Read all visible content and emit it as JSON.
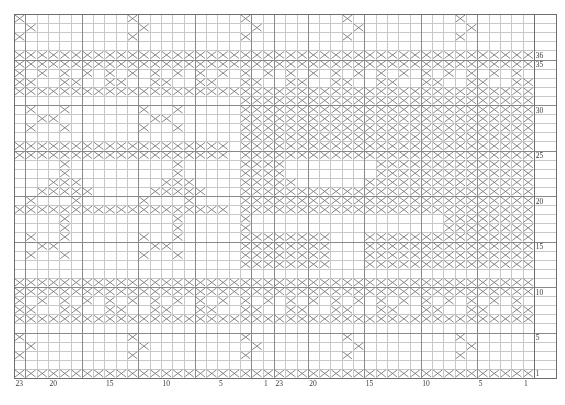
{
  "chart_data": {
    "type": "heatmap",
    "title": "",
    "subtitle": "",
    "xlabel": "",
    "ylabel": "",
    "grid": true,
    "legend_position": "none",
    "cols": 46,
    "rows": 40,
    "repeat_width": 23,
    "repeats": 2,
    "cell_symbol": "cross",
    "x": [
      1,
      2,
      3,
      4,
      5,
      6,
      7,
      8,
      9,
      10,
      11,
      12,
      13,
      14,
      15,
      16,
      17,
      18,
      19,
      20,
      21,
      22,
      23,
      1,
      2,
      3,
      4,
      5,
      6,
      7,
      8,
      9,
      10,
      11,
      12,
      13,
      14,
      15,
      16,
      17,
      18,
      19,
      20,
      21,
      22,
      23
    ],
    "xtick_values": [
      23,
      20,
      15,
      10,
      5,
      1,
      23,
      20,
      15,
      10,
      5,
      1
    ],
    "xtick_labels": [
      "23",
      "20",
      "15",
      "10",
      "5",
      "1",
      "23",
      "20",
      "15",
      "10",
      "5",
      "1"
    ],
    "xtick_cols": [
      1,
      4,
      9,
      14,
      19,
      23,
      24,
      27,
      32,
      37,
      42,
      46
    ],
    "ytick_labels": [
      "36",
      "35",
      "30",
      "25",
      "20",
      "15",
      "10",
      "5",
      "1"
    ],
    "ytick_rows": [
      36,
      35,
      30,
      25,
      20,
      15,
      10,
      5,
      1
    ],
    "ytick_display_rows": [
      5,
      6,
      11,
      16,
      21,
      26,
      31,
      36,
      40
    ],
    "colors": {
      "grid_minor": "#c8c8c8",
      "grid_major": "#8a8a8a",
      "border": "#6e6e6e",
      "symbol": "#7a7a7a",
      "background": "#ffffff",
      "label": "#3a3a3a"
    },
    "geometry": {
      "origin_x": 14,
      "origin_y": 14,
      "cell_w": 11.3,
      "cell_h": 9.1,
      "label_col_w": 22
    },
    "matrix": [
      "1000000000100000000010000000010000000001000000",
      "0100000000010000000001000000001000000000100000",
      "1000000000100000000010000000010000000001000000",
      "0000000000000000000000000000000000000000000000",
      "1111111111111111111111111111111111111111111111",
      "1111111111111111111111111111111111111111111111",
      "1010101010101010101010101010101010101010101010",
      "1100110011001100110011001100110011001100110011",
      "1111111111111111111111111111111111111111111111",
      "0000000000000000000011111111111111111111111111",
      "0100100000010010000011111111111111111111111111",
      "0011000000001100000011111111111111111111111111",
      "0100100000010010000011111111111111111111111111",
      "0000000000000000000011111111111111111111111111",
      "1111111111111111111011111111111111111111111111",
      "1111111111111111111011111111111111111111111111",
      "0000100000000010000011110000000011111111111111",
      "0000100000000010000011110000000011111111111111",
      "0001110000000111000011111000000111111111111111",
      "0011111000001111100011111111111111111111111111",
      "0100010000010001000011111111111111111111111111",
      "1111111111111111111011111111111111111111111111",
      "0000100000000010000010000000000000000011111111",
      "0000100000000010000010000000000000000011111111",
      "0100100000010010000011111111000111111111111111",
      "0011000000001100000011111111000111111111111111",
      "0100100000010010000011111111000111111111111111",
      "0000000000000000000011111111000111111111111111",
      "0000000000000000000000000000000000000000000000",
      "1111111111111111111111111111111111111111111111",
      "1111111111111111111111111111111111111111111111",
      "1010101010101010101010101010101010101010101010",
      "1100110011001100110011001100110011001100110011",
      "1111111111111111111111111111111111111111111111",
      "0000000000000000000000000000000000000000000000",
      "1000000000100000000010000000010000000001000000",
      "0100000000010000000001000000001000000000100000",
      "1000000000100000000010000000010000000001000000",
      "0000000000000000000000000000000000000000000000",
      "1111111111111111111111111111111111111111111111"
    ]
  }
}
